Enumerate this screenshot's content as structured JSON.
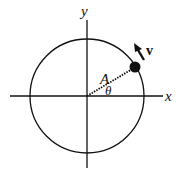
{
  "diagram": {
    "type": "circular-motion",
    "axes": {
      "x_label": "x",
      "y_label": "y"
    },
    "radius_label": "A",
    "angle_label": "θ",
    "velocity_label": "v",
    "colors": {
      "stroke": "#111111",
      "background": "#ffffff"
    }
  }
}
